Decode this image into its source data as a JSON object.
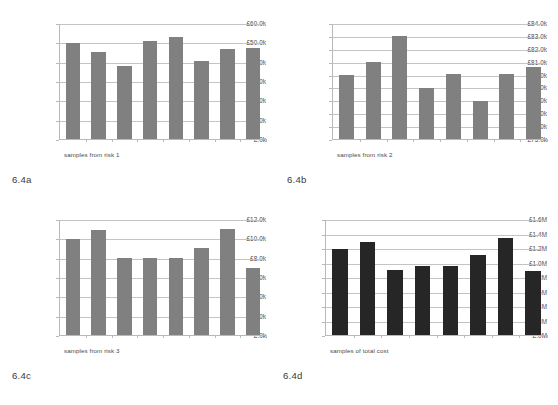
{
  "figure": {
    "panels": [
      {
        "caption": "6.4a",
        "xlabel": "samples from risk 1",
        "chart_data": {
          "type": "bar",
          "title": "",
          "xlabel": "samples from risk 1",
          "ylabel": "",
          "categories": [
            "1",
            "2",
            "3",
            "4",
            "5",
            "6",
            "7",
            "8"
          ],
          "values": [
            50.0,
            45.2,
            38.3,
            51.3,
            53.3,
            40.5,
            47.0,
            47.6
          ],
          "unit": "£k",
          "ylim": [
            0,
            60
          ],
          "ytick_values": [
            60,
            50,
            40,
            30,
            20,
            10,
            0
          ],
          "ytick_labels": [
            "£60.0k",
            "£50.0k",
            "£40.0k",
            "£30.0k",
            "£20.0k",
            "£10.0k",
            "£.0k"
          ],
          "grid": true,
          "legend": false,
          "bar_color": "#808080"
        }
      },
      {
        "caption": "6.4b",
        "xlabel": "samples from risk 2",
        "chart_data": {
          "type": "bar",
          "title": "",
          "xlabel": "samples from risk 2",
          "ylabel": "",
          "categories": [
            "1",
            "2",
            "3",
            "4",
            "5",
            "6",
            "7",
            "8"
          ],
          "values": [
            80.0,
            81.0,
            83.05,
            79.0,
            80.05,
            78.0,
            80.1,
            80.6
          ],
          "unit": "£k",
          "ylim": [
            75,
            84
          ],
          "ytick_values": [
            84,
            83,
            82,
            81,
            80,
            79,
            78,
            77,
            76,
            75
          ],
          "ytick_labels": [
            "£84.0k",
            "£83.0k",
            "£82.0k",
            "£81.0k",
            "£80.0k",
            "£79.0k",
            "£78.0k",
            "£77.0k",
            "£76.0k",
            "£75.0k"
          ],
          "grid": true,
          "legend": false,
          "bar_color": "#808080"
        }
      },
      {
        "caption": "6.4c",
        "xlabel": "samples from risk 3",
        "chart_data": {
          "type": "bar",
          "title": "",
          "xlabel": "samples from risk 3",
          "ylabel": "",
          "categories": [
            "1",
            "2",
            "3",
            "4",
            "5",
            "6",
            "7",
            "8"
          ],
          "values": [
            10.0,
            11.0,
            8.0,
            8.05,
            8.05,
            9.1,
            11.1,
            7.0
          ],
          "unit": "£k",
          "ylim": [
            0,
            12
          ],
          "ytick_values": [
            12,
            10,
            8,
            6,
            4,
            2,
            0
          ],
          "ytick_labels": [
            "£12.0k",
            "£10.0k",
            "£8.0k",
            "£6.0k",
            "£4.0k",
            "£2.0k",
            "£.0k"
          ],
          "grid": true,
          "legend": false,
          "bar_color": "#808080"
        }
      },
      {
        "caption": "6.4d",
        "xlabel": "samples of total cost",
        "chart_data": {
          "type": "bar",
          "title": "",
          "xlabel": "samples of total cost",
          "ylabel": "",
          "categories": [
            "1",
            "2",
            "3",
            "4",
            "5",
            "6",
            "7",
            "8"
          ],
          "values": [
            1.19,
            1.3,
            0.9,
            0.955,
            0.965,
            1.115,
            1.355,
            0.895
          ],
          "unit": "£M",
          "ylim": [
            0,
            1.6
          ],
          "ytick_values": [
            1.6,
            1.4,
            1.2,
            1.0,
            0.8,
            0.6,
            0.4,
            0.2,
            0
          ],
          "ytick_labels": [
            "£1.6M",
            "£1.4M",
            "£1.2M",
            "£1.0M",
            "£.8M",
            "£.6M",
            "£.4M",
            "£.2M",
            "£.0M"
          ],
          "grid": true,
          "legend": false,
          "bar_color": "#262626"
        }
      }
    ]
  }
}
